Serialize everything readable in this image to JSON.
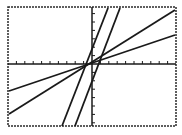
{
  "chart_data": {
    "type": "line",
    "title": "",
    "xlabel": "",
    "ylabel": "",
    "grid": false,
    "legend": "none",
    "xlim": [
      -10,
      10
    ],
    "ylim": [
      -7,
      7
    ],
    "x_ticks_step": 1,
    "y_ticks_step": 1,
    "series": [
      {
        "name": "steep line 1",
        "slope": 2.6,
        "intercept": 0,
        "pixels": {
          "x1": 108,
          "y1": 8,
          "x2": 62,
          "y2": 126
        }
      },
      {
        "name": "steep line 2",
        "slope": 2.6,
        "intercept": 0,
        "pixels": {
          "x1": 120,
          "y1": 8,
          "x2": 75,
          "y2": 126
        }
      },
      {
        "name": "moderate line",
        "slope": 0.63,
        "intercept": 0,
        "pixels": {
          "x1": 9,
          "y1": 114,
          "x2": 175,
          "y2": 10
        }
      },
      {
        "name": "shallow line",
        "slope": 0.34,
        "intercept": 0,
        "pixels": {
          "x1": 9,
          "y1": 91,
          "x2": 175,
          "y2": 35
        }
      }
    ]
  },
  "frame": {
    "left": 8,
    "top": 7,
    "right": 176,
    "bottom": 126
  },
  "axes": {
    "origin_x": 92,
    "origin_y": 64,
    "x_tick_spacing": 8.4,
    "y_tick_spacing": 8.4
  },
  "colors": {
    "ink": "#1a1a1a",
    "background": "#ffffff"
  }
}
